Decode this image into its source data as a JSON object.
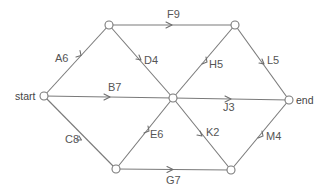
{
  "diagram": {
    "type": "directed-network",
    "nodes": [
      {
        "id": "start",
        "label": "start",
        "x": 44,
        "y": 96
      },
      {
        "id": "n1",
        "label": "",
        "x": 109,
        "y": 25
      },
      {
        "id": "n2",
        "label": "",
        "x": 116,
        "y": 169
      },
      {
        "id": "n3",
        "label": "",
        "x": 173,
        "y": 98
      },
      {
        "id": "n4",
        "label": "",
        "x": 235,
        "y": 25
      },
      {
        "id": "n5",
        "label": "",
        "x": 231,
        "y": 170
      },
      {
        "id": "end",
        "label": "end",
        "x": 289,
        "y": 100
      }
    ],
    "edges": [
      {
        "id": "A",
        "label": "A6",
        "from": "start",
        "to": "n1",
        "weight": 6
      },
      {
        "id": "B",
        "label": "B7",
        "from": "start",
        "to": "n3",
        "weight": 7
      },
      {
        "id": "C",
        "label": "C8",
        "from": "start",
        "to": "n2",
        "weight": 8
      },
      {
        "id": "D",
        "label": "D4",
        "from": "n1",
        "to": "n3",
        "weight": 4
      },
      {
        "id": "E",
        "label": "E6",
        "from": "n2",
        "to": "n3",
        "weight": 6
      },
      {
        "id": "F",
        "label": "F9",
        "from": "n1",
        "to": "n4",
        "weight": 9
      },
      {
        "id": "G",
        "label": "G7",
        "from": "n2",
        "to": "n5",
        "weight": 7
      },
      {
        "id": "H",
        "label": "H5",
        "from": "n3",
        "to": "n4",
        "weight": 5
      },
      {
        "id": "J",
        "label": "J3",
        "from": "n3",
        "to": "end",
        "weight": 3
      },
      {
        "id": "K",
        "label": "K2",
        "from": "n3",
        "to": "n5",
        "weight": 2
      },
      {
        "id": "L",
        "label": "L5",
        "from": "n4",
        "to": "end",
        "weight": 5
      },
      {
        "id": "M",
        "label": "M4",
        "from": "n5",
        "to": "end",
        "weight": 4
      }
    ]
  },
  "labels": {
    "start": "start",
    "end": "end",
    "A": "A6",
    "B": "B7",
    "C": "C8",
    "D": "D4",
    "E": "E6",
    "F": "F9",
    "G": "G7",
    "H": "H5",
    "J": "J3",
    "K": "K2",
    "L": "L5",
    "M": "M4"
  },
  "colors": {
    "edge": "#7a7a7a",
    "text": "#555555",
    "background": "#ffffff"
  }
}
